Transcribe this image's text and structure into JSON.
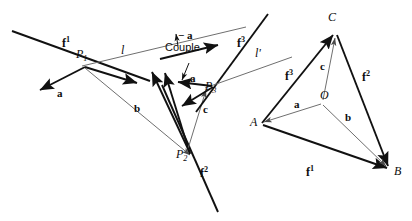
{
  "figure": {
    "background_color": "#ffffff",
    "ink_color": "#111111",
    "thin_ink_color": "#6b6b6b",
    "width": 412,
    "height": 221
  },
  "left_diagram": {
    "name": "force-lines-diagram",
    "labels": {
      "f1": "f",
      "f1_sup": "1",
      "f2": "f",
      "f2_sup": "2",
      "f3": "f",
      "f3_sup": "3",
      "line_l": "l",
      "line_l_prime": "l'",
      "point_p1": "P",
      "point_p1_sub": "1",
      "point_p2": "P",
      "point_p2_sub": "2",
      "point_p3": "P",
      "point_p3_sub": "3",
      "vec_a": "a",
      "vec_b": "b",
      "vec_c": "c",
      "vec_minus_a": "− a",
      "vec_a_couple": "a",
      "couple": "Couple"
    }
  },
  "right_diagram": {
    "name": "force-polygon-diagram",
    "labels": {
      "vertex_a": "A",
      "vertex_b": "B",
      "vertex_c": "C",
      "vertex_o": "O",
      "f1": "f",
      "f1_sup": "1",
      "f2": "f",
      "f2_sup": "2",
      "f3": "f",
      "f3_sup": "3",
      "ray_a": "a",
      "ray_b": "b",
      "ray_c": "c"
    }
  }
}
